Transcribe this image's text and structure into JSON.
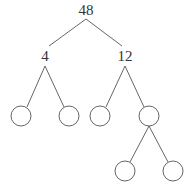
{
  "diagram": {
    "type": "factor-tree",
    "colors": {
      "line": "#555555",
      "text": "#333333",
      "background": "#ffffff"
    },
    "nodes": [
      {
        "id": "root",
        "label": "48",
        "shape": "text",
        "x": 86,
        "y": 13
      },
      {
        "id": "n4",
        "label": "4",
        "shape": "text",
        "x": 45,
        "y": 59
      },
      {
        "id": "n12",
        "label": "12",
        "shape": "text",
        "x": 125,
        "y": 59
      },
      {
        "id": "c1",
        "label": "",
        "shape": "circle",
        "x": 21,
        "y": 116,
        "r": 10
      },
      {
        "id": "c2",
        "label": "",
        "shape": "circle",
        "x": 69,
        "y": 116,
        "r": 10
      },
      {
        "id": "c3",
        "label": "",
        "shape": "circle",
        "x": 100,
        "y": 116,
        "r": 10
      },
      {
        "id": "c4",
        "label": "",
        "shape": "circle",
        "x": 149,
        "y": 116,
        "r": 10
      },
      {
        "id": "c5",
        "label": "",
        "shape": "circle",
        "x": 125,
        "y": 171,
        "r": 10
      },
      {
        "id": "c6",
        "label": "",
        "shape": "circle",
        "x": 173,
        "y": 171,
        "r": 10
      }
    ],
    "edges": [
      {
        "from": "root",
        "to": "n4"
      },
      {
        "from": "root",
        "to": "n12"
      },
      {
        "from": "n4",
        "to": "c1"
      },
      {
        "from": "n4",
        "to": "c2"
      },
      {
        "from": "n12",
        "to": "c3"
      },
      {
        "from": "n12",
        "to": "c4"
      },
      {
        "from": "c4",
        "to": "c5"
      },
      {
        "from": "c4",
        "to": "c6"
      }
    ],
    "labels": {
      "root": "48",
      "left": "4",
      "right": "12"
    }
  }
}
